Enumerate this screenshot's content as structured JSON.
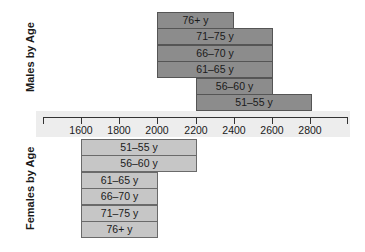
{
  "chart_data": {
    "type": "bar",
    "orientation": "horizontal",
    "title": "",
    "xlabel": "",
    "axis": {
      "ticks": [
        1600,
        1800,
        2000,
        2200,
        2400,
        2600,
        2800
      ],
      "tick_labels": [
        "1600",
        "1800",
        "2000",
        "2200",
        "2400",
        "2600",
        "2800"
      ],
      "range": [
        1400,
        3000
      ],
      "grid": false
    },
    "series": [
      {
        "name": "Males by Age",
        "color": "#8c8c8c",
        "bars": [
          {
            "label": "76+ y",
            "start": 2000,
            "end": 2400
          },
          {
            "label": "71–75 y",
            "start": 2000,
            "end": 2600
          },
          {
            "label": "66–70 y",
            "start": 2000,
            "end": 2600
          },
          {
            "label": "61–65 y",
            "start": 2000,
            "end": 2600
          },
          {
            "label": "56–60 y",
            "start": 2200,
            "end": 2600
          },
          {
            "label": "51–55 y",
            "start": 2200,
            "end": 2800
          }
        ]
      },
      {
        "name": "Females by Age",
        "color": "#c6c6c6",
        "bars": [
          {
            "label": "51–55 y",
            "start": 1600,
            "end": 2200
          },
          {
            "label": "56–60 y",
            "start": 1600,
            "end": 2200
          },
          {
            "label": "61–65 y",
            "start": 1600,
            "end": 2000
          },
          {
            "label": "66–70 y",
            "start": 1600,
            "end": 2000
          },
          {
            "label": "71–75 y",
            "start": 1600,
            "end": 2000
          },
          {
            "label": "76+ y",
            "start": 1600,
            "end": 2000
          }
        ]
      }
    ]
  },
  "labels": {
    "males": "Males by Age",
    "females": "Females by Age"
  }
}
